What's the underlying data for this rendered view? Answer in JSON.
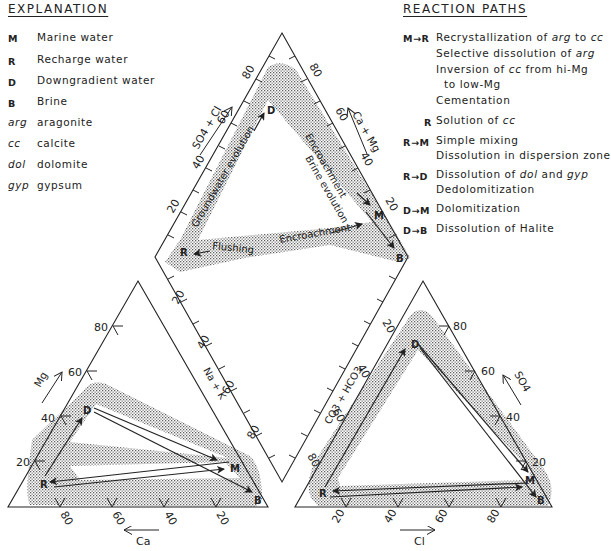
{
  "explanation": {
    "title": "EXPLANATION",
    "items": [
      {
        "key": "M",
        "style": "bold",
        "label": "Marine water"
      },
      {
        "key": "R",
        "style": "bold",
        "label": "Recharge water"
      },
      {
        "key": "D",
        "style": "bold",
        "label": "Downgradient water"
      },
      {
        "key": "B",
        "style": "bold",
        "label": "Brine"
      },
      {
        "key": "arg",
        "style": "italic",
        "label": "aragonite"
      },
      {
        "key": "cc",
        "style": "italic",
        "label": "calcite"
      },
      {
        "key": "dol",
        "style": "italic",
        "label": "dolomite"
      },
      {
        "key": "gyp",
        "style": "italic",
        "label": "gypsum"
      }
    ]
  },
  "reaction_paths": {
    "title": "REACTION PATHS",
    "items": [
      {
        "key": "M→R",
        "lines": [
          "Recrystallization of arg to cc",
          "Selective dissolution of arg",
          "Inversion of cc from hi-Mg",
          "  to low-Mg",
          "Cementation"
        ]
      },
      {
        "key": "R",
        "lines": [
          "Solution of cc"
        ]
      },
      {
        "key": "R→M",
        "lines": [
          "Simple mixing",
          "Dissolution in dispersion zone"
        ]
      },
      {
        "key": "R→D",
        "lines": [
          "Dissolution of dol and gyp",
          "Dedolomitization"
        ]
      },
      {
        "key": "D→M",
        "lines": [
          "Dolomitization"
        ]
      },
      {
        "key": "D→B",
        "lines": [
          "Dissolution of Halite"
        ]
      }
    ],
    "rich": {
      "mr1a": "Recrystallization of ",
      "mr1b": "arg",
      "mr1c": " to ",
      "mr1d": "cc",
      "mr2a": "Selective dissolution of ",
      "mr2b": "arg",
      "mr3a": "Inversion of ",
      "mr3b": "cc",
      "mr3c": " from hi-Mg",
      "mr4": "to low-Mg",
      "mr5": "Cementation",
      "r1a": "Solution of ",
      "r1b": "cc",
      "rm1": "Simple mixing",
      "rm2": "Dissolution in dispersion zone",
      "rd1a": "Dissolution of ",
      "rd1b": "dol",
      "rd1c": " and ",
      "rd1d": "gyp",
      "rd2": "Dedolomitization",
      "dm1": "Dolomitization",
      "db1": "Dissolution of Halite"
    }
  },
  "diagram": {
    "type": "piper",
    "points": {
      "M": "Marine water",
      "R": "Recharge water",
      "D": "Downgradient water",
      "B": "Brine"
    },
    "diamond": {
      "left_axis_label": "SO4 + Cl",
      "right_axis_label": "Ca + Mg",
      "left_ticks": [
        "20",
        "40",
        "60",
        "80"
      ],
      "right_ticks": [
        "20",
        "40",
        "60",
        "80"
      ],
      "bottom_left_ticks": [
        "20",
        "40",
        "60",
        "80"
      ],
      "bottom_right_ticks": [
        "20",
        "40",
        "60",
        "80"
      ],
      "bottom_left_label": "Na + K",
      "bottom_right_label": "CO3 + HCO3",
      "annotations": [
        "Groundwater evolution",
        "Encroachment",
        "Brine evolution",
        "Flushing",
        "Encroachment"
      ]
    },
    "cation_triangle": {
      "left_axis_label": "Mg",
      "bottom_axis_label": "Ca",
      "left_ticks": [
        "20",
        "40",
        "60",
        "80"
      ],
      "bottom_ticks": [
        "80",
        "60",
        "40",
        "20"
      ]
    },
    "anion_triangle": {
      "right_axis_label": "SO4",
      "bottom_axis_label": "Cl",
      "right_ticks": [
        "20",
        "40",
        "60",
        "80"
      ],
      "bottom_ticks": [
        "20",
        "40",
        "60",
        "80"
      ]
    },
    "labels": {
      "M": "M",
      "R": "R",
      "D": "D",
      "B": "B",
      "so4cl": "SO4 + Cl",
      "camg": "Ca + Mg",
      "nak": "Na + K",
      "co3": "CO3 + HCO3",
      "mg": "Mg",
      "ca": "Ca",
      "so4": "SO4",
      "cl": "Cl",
      "gw": "Groundwater evolution",
      "enc1": "Encroachment",
      "brine": "Brine evolution",
      "flush": "Flushing",
      "enc2": "Encroachment",
      "t20": "20",
      "t40": "40",
      "t60": "60",
      "t80": "80"
    }
  }
}
